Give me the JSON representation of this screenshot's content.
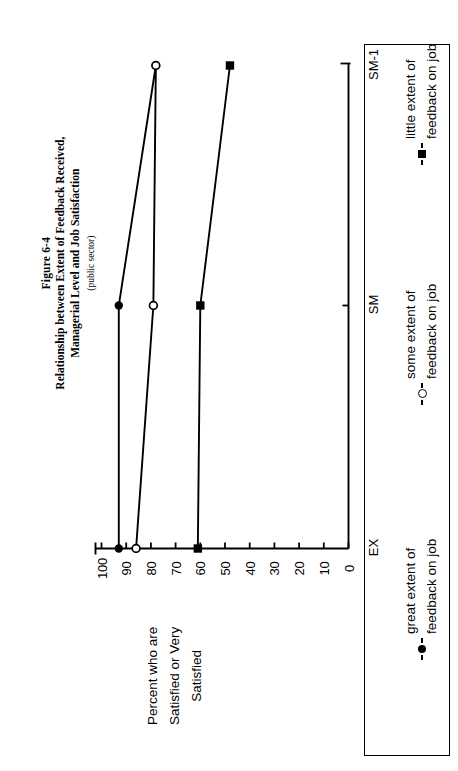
{
  "figure": {
    "number": "Figure 6-4",
    "title_line1": "Relationship between Extent of Feedback Received,",
    "title_line2": "Managerial Level and Job Satisfaction",
    "subtitle": "(public sector)"
  },
  "axis": {
    "y_title_line1": "Percent who are",
    "y_title_line2": "Satisfied or Very",
    "y_title_line3": "Satisfied"
  },
  "legend": {
    "items": [
      {
        "marker": "filled-circle",
        "line1": "great extent of",
        "line2": "feedback on job"
      },
      {
        "marker": "open-circle",
        "line1": "some extent of",
        "line2": "feedback on job"
      },
      {
        "marker": "filled-square",
        "line1": "little extent of",
        "line2": "feedback on job"
      }
    ]
  },
  "chart_data": {
    "type": "line",
    "title": "Relationship between Extent of Feedback Received, Managerial Level and Job Satisfaction",
    "subtitle": "(public sector)",
    "orientation": "rotated-90-ccw",
    "xlabel": "",
    "ylabel": "Percent who are Satisfied or Very Satisfied",
    "categories": [
      "EX",
      "SM",
      "SM-1"
    ],
    "ylim": [
      0,
      100
    ],
    "yticks": [
      100,
      90,
      80,
      70,
      60,
      50,
      40,
      30,
      20,
      10,
      0
    ],
    "grid": false,
    "legend_position": "right-box",
    "series": [
      {
        "name": "great extent of feedback on job",
        "marker": "filled-circle",
        "values": [
          93,
          93,
          78
        ]
      },
      {
        "name": "some extent of feedback on job",
        "marker": "open-circle",
        "values": [
          86,
          79,
          78
        ]
      },
      {
        "name": "little extent of feedback on job",
        "marker": "filled-square",
        "values": [
          61,
          60,
          48
        ]
      }
    ]
  },
  "ticks": {
    "labels": [
      "100",
      "90",
      "80",
      "70",
      "60",
      "50",
      "40",
      "30",
      "20",
      "10",
      "0"
    ]
  }
}
